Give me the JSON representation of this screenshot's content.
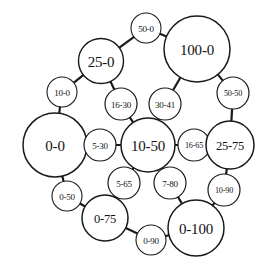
{
  "diagram": {
    "type": "node-link-bubble-graph",
    "canvas": {
      "width": 268,
      "height": 275
    },
    "style": {
      "background_color": "#ffffff",
      "node_fill": "#ffffff",
      "node_stroke": "#1a1a1a",
      "edge_stroke": "#1a1a1a",
      "label_color": "#111111"
    },
    "nodes": [
      {
        "id": "n0_0",
        "label": "0-0",
        "cx": 55,
        "cy": 145,
        "r": 32,
        "stroke_width": 1.5,
        "size_class": "size-large",
        "font_size": 16
      },
      {
        "id": "n25_0",
        "label": "25-0",
        "cx": 101,
        "cy": 61,
        "r": 22.5,
        "stroke_width": 1.4,
        "size_class": "size-large",
        "font_size": 14
      },
      {
        "id": "n100_0",
        "label": "100-0",
        "cx": 197,
        "cy": 49,
        "r": 33,
        "stroke_width": 1.5,
        "size_class": "size-large",
        "font_size": 15
      },
      {
        "id": "n50_0",
        "label": "50-0",
        "cx": 146,
        "cy": 28,
        "r": 15,
        "stroke_width": 1.1,
        "size_class": "size-small",
        "font_size": 9.2
      },
      {
        "id": "n10_0",
        "label": "10-0",
        "cx": 62,
        "cy": 92,
        "r": 15,
        "stroke_width": 1.1,
        "size_class": "size-small",
        "font_size": 9.2
      },
      {
        "id": "n16_30",
        "label": "16-30",
        "cx": 121,
        "cy": 104,
        "r": 16,
        "stroke_width": 1.2,
        "size_class": "size-small",
        "font_size": 9.2
      },
      {
        "id": "n30_41",
        "label": "30-41",
        "cx": 165,
        "cy": 104,
        "r": 16,
        "stroke_width": 1.2,
        "size_class": "size-small",
        "font_size": 9.2
      },
      {
        "id": "n50_50",
        "label": "50-50",
        "cx": 233,
        "cy": 93,
        "r": 16,
        "stroke_width": 1.2,
        "size_class": "size-tiny",
        "font_size": 8.4
      },
      {
        "id": "n5_30",
        "label": "5-30",
        "cx": 100,
        "cy": 145,
        "r": 16,
        "stroke_width": 1.2,
        "size_class": "size-small",
        "font_size": 9.2
      },
      {
        "id": "n10_50",
        "label": "10-50",
        "cx": 148,
        "cy": 145,
        "r": 27,
        "stroke_width": 1.5,
        "size_class": "size-large",
        "font_size": 14
      },
      {
        "id": "n16_65",
        "label": "16-65",
        "cx": 194,
        "cy": 145,
        "r": 16,
        "stroke_width": 1.2,
        "size_class": "size-tiny",
        "font_size": 8.6
      },
      {
        "id": "n25_75",
        "label": "25-75",
        "cx": 230,
        "cy": 145,
        "r": 24,
        "stroke_width": 1.5,
        "size_class": "size-medium",
        "font_size": 13
      },
      {
        "id": "n5_65",
        "label": "5-65",
        "cx": 124,
        "cy": 183,
        "r": 16,
        "stroke_width": 1.2,
        "size_class": "size-small",
        "font_size": 9.2
      },
      {
        "id": "n7_80",
        "label": "7-80",
        "cx": 170,
        "cy": 183,
        "r": 16,
        "stroke_width": 1.2,
        "size_class": "size-small",
        "font_size": 9.2
      },
      {
        "id": "n0_50",
        "label": "0-50",
        "cx": 67,
        "cy": 196,
        "r": 15,
        "stroke_width": 1.1,
        "size_class": "size-small",
        "font_size": 9.2
      },
      {
        "id": "n10_90",
        "label": "10-90",
        "cx": 224,
        "cy": 190,
        "r": 16,
        "stroke_width": 1.2,
        "size_class": "size-tiny",
        "font_size": 8.4
      },
      {
        "id": "n0_75",
        "label": "0-75",
        "cx": 105,
        "cy": 218,
        "r": 23,
        "stroke_width": 1.5,
        "size_class": "size-medium",
        "font_size": 13.5
      },
      {
        "id": "n0_90",
        "label": "0-90",
        "cx": 151,
        "cy": 240,
        "r": 15,
        "stroke_width": 1.1,
        "size_class": "size-small",
        "font_size": 9
      },
      {
        "id": "n0_100",
        "label": "0-100",
        "cx": 196,
        "cy": 228,
        "r": 28,
        "stroke_width": 1.5,
        "size_class": "size-large",
        "font_size": 14
      }
    ],
    "edges": [
      {
        "from": "n0_0",
        "to": "n10_0",
        "width": 2.2
      },
      {
        "from": "n10_0",
        "to": "n25_0",
        "width": 2.2
      },
      {
        "from": "n25_0",
        "to": "n50_0",
        "width": 2.2
      },
      {
        "from": "n50_0",
        "to": "n100_0",
        "width": 2.2
      },
      {
        "from": "n25_0",
        "to": "n16_30",
        "width": 2.2
      },
      {
        "from": "n100_0",
        "to": "n30_41",
        "width": 2.2
      },
      {
        "from": "n100_0",
        "to": "n50_50",
        "width": 2.2
      },
      {
        "from": "n50_50",
        "to": "n25_75",
        "width": 2.2
      },
      {
        "from": "n16_30",
        "to": "n10_50",
        "width": 2.2
      },
      {
        "from": "n30_41",
        "to": "n10_50",
        "width": 2.2
      },
      {
        "from": "n0_0",
        "to": "n5_30",
        "width": 1.8
      },
      {
        "from": "n5_30",
        "to": "n10_50",
        "width": 1.8
      },
      {
        "from": "n10_50",
        "to": "n16_65",
        "width": 1.8
      },
      {
        "from": "n16_65",
        "to": "n25_75",
        "width": 1.8
      },
      {
        "from": "n10_50",
        "to": "n5_65",
        "width": 2.2
      },
      {
        "from": "n10_50",
        "to": "n7_80",
        "width": 2.2
      },
      {
        "from": "n0_0",
        "to": "n0_50",
        "width": 2.2
      },
      {
        "from": "n0_50",
        "to": "n0_75",
        "width": 2.2
      },
      {
        "from": "n5_65",
        "to": "n0_75",
        "width": 2.2
      },
      {
        "from": "n7_80",
        "to": "n0_100",
        "width": 2.2
      },
      {
        "from": "n0_75",
        "to": "n0_90",
        "width": 2.2
      },
      {
        "from": "n0_90",
        "to": "n0_100",
        "width": 2.2
      },
      {
        "from": "n25_75",
        "to": "n10_90",
        "width": 2.2
      },
      {
        "from": "n10_90",
        "to": "n0_100",
        "width": 2.2
      }
    ]
  }
}
